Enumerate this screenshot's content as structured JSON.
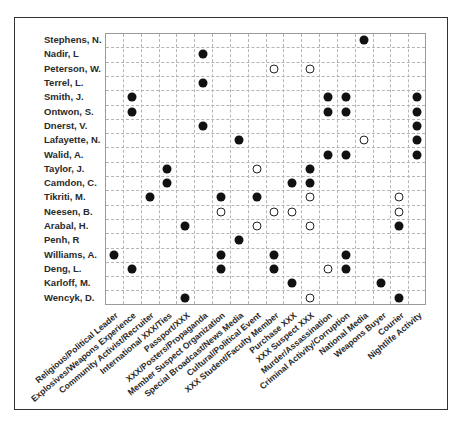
{
  "chart_data": {
    "type": "scatter",
    "subtype": "binary-matrix",
    "title": "",
    "xlabel": "",
    "ylabel": "",
    "grid": true,
    "legend": null,
    "marker_types": {
      "filled": "filled circle",
      "open": "open circle"
    },
    "rows": [
      "Stephens, N.",
      "Nadir, L",
      "Peterson, W.",
      "Terrel, L.",
      "Smith, J.",
      "Ontwon, S.",
      "Dnerst, V.",
      "Lafayette, N.",
      "Walid, A.",
      "Taylor, J.",
      "Camdon, C.",
      "Tikriti, M.",
      "Neesen, B.",
      "Arabal, H.",
      "Penh, R",
      "Williams, A.",
      "Deng, L.",
      "Karloff, M.",
      "Wencyk, D."
    ],
    "columns": [
      "Religious/Political Leader",
      "Explosives/Weapons Experience",
      "Community Activist/Recruiter",
      "International XXX/Ties",
      "Passport/XXX",
      "XXX/Posters/Propaganda",
      "Member Suspect Organization",
      "Special Broadcast/News Media",
      "Cultural/Political Event",
      "XXX Student/Faculty Member",
      "Purchase XXX",
      "XXX Suspect XXX",
      "Murder/Assassination",
      "Criminal Activity/Corruption",
      "National Media",
      "Weapons Buyer",
      "Courier",
      "Nightlife Activity"
    ],
    "points": [
      {
        "row": 0,
        "col": 14,
        "marker": "filled"
      },
      {
        "row": 1,
        "col": 5,
        "marker": "filled"
      },
      {
        "row": 2,
        "col": 9,
        "marker": "open"
      },
      {
        "row": 2,
        "col": 11,
        "marker": "open"
      },
      {
        "row": 3,
        "col": 5,
        "marker": "filled"
      },
      {
        "row": 4,
        "col": 1,
        "marker": "filled"
      },
      {
        "row": 4,
        "col": 12,
        "marker": "filled"
      },
      {
        "row": 4,
        "col": 13,
        "marker": "filled"
      },
      {
        "row": 4,
        "col": 17,
        "marker": "filled"
      },
      {
        "row": 5,
        "col": 1,
        "marker": "filled"
      },
      {
        "row": 5,
        "col": 12,
        "marker": "filled"
      },
      {
        "row": 5,
        "col": 13,
        "marker": "filled"
      },
      {
        "row": 5,
        "col": 17,
        "marker": "filled"
      },
      {
        "row": 6,
        "col": 5,
        "marker": "filled"
      },
      {
        "row": 6,
        "col": 17,
        "marker": "filled"
      },
      {
        "row": 7,
        "col": 7,
        "marker": "filled"
      },
      {
        "row": 7,
        "col": 14,
        "marker": "open"
      },
      {
        "row": 7,
        "col": 17,
        "marker": "filled"
      },
      {
        "row": 8,
        "col": 12,
        "marker": "filled"
      },
      {
        "row": 8,
        "col": 13,
        "marker": "filled"
      },
      {
        "row": 8,
        "col": 17,
        "marker": "filled"
      },
      {
        "row": 9,
        "col": 3,
        "marker": "filled"
      },
      {
        "row": 9,
        "col": 8,
        "marker": "open"
      },
      {
        "row": 9,
        "col": 11,
        "marker": "filled"
      },
      {
        "row": 10,
        "col": 3,
        "marker": "filled"
      },
      {
        "row": 10,
        "col": 10,
        "marker": "filled"
      },
      {
        "row": 10,
        "col": 11,
        "marker": "filled"
      },
      {
        "row": 11,
        "col": 2,
        "marker": "filled"
      },
      {
        "row": 11,
        "col": 6,
        "marker": "filled"
      },
      {
        "row": 11,
        "col": 8,
        "marker": "filled"
      },
      {
        "row": 11,
        "col": 11,
        "marker": "open"
      },
      {
        "row": 11,
        "col": 16,
        "marker": "open"
      },
      {
        "row": 12,
        "col": 6,
        "marker": "open"
      },
      {
        "row": 12,
        "col": 9,
        "marker": "open"
      },
      {
        "row": 12,
        "col": 10,
        "marker": "open"
      },
      {
        "row": 12,
        "col": 16,
        "marker": "open"
      },
      {
        "row": 13,
        "col": 4,
        "marker": "filled"
      },
      {
        "row": 13,
        "col": 8,
        "marker": "open"
      },
      {
        "row": 13,
        "col": 11,
        "marker": "open"
      },
      {
        "row": 13,
        "col": 16,
        "marker": "filled"
      },
      {
        "row": 14,
        "col": 7,
        "marker": "filled"
      },
      {
        "row": 15,
        "col": 0,
        "marker": "filled"
      },
      {
        "row": 15,
        "col": 6,
        "marker": "filled"
      },
      {
        "row": 15,
        "col": 9,
        "marker": "filled"
      },
      {
        "row": 15,
        "col": 13,
        "marker": "filled"
      },
      {
        "row": 16,
        "col": 1,
        "marker": "filled"
      },
      {
        "row": 16,
        "col": 6,
        "marker": "filled"
      },
      {
        "row": 16,
        "col": 9,
        "marker": "filled"
      },
      {
        "row": 16,
        "col": 12,
        "marker": "open"
      },
      {
        "row": 16,
        "col": 13,
        "marker": "filled"
      },
      {
        "row": 17,
        "col": 10,
        "marker": "filled"
      },
      {
        "row": 17,
        "col": 15,
        "marker": "filled"
      },
      {
        "row": 18,
        "col": 4,
        "marker": "filled"
      },
      {
        "row": 18,
        "col": 11,
        "marker": "open"
      },
      {
        "row": 18,
        "col": 16,
        "marker": "filled"
      }
    ],
    "colors": {
      "marker": "#111111",
      "grid": "#b5b5b5",
      "frame": "#333333"
    }
  }
}
